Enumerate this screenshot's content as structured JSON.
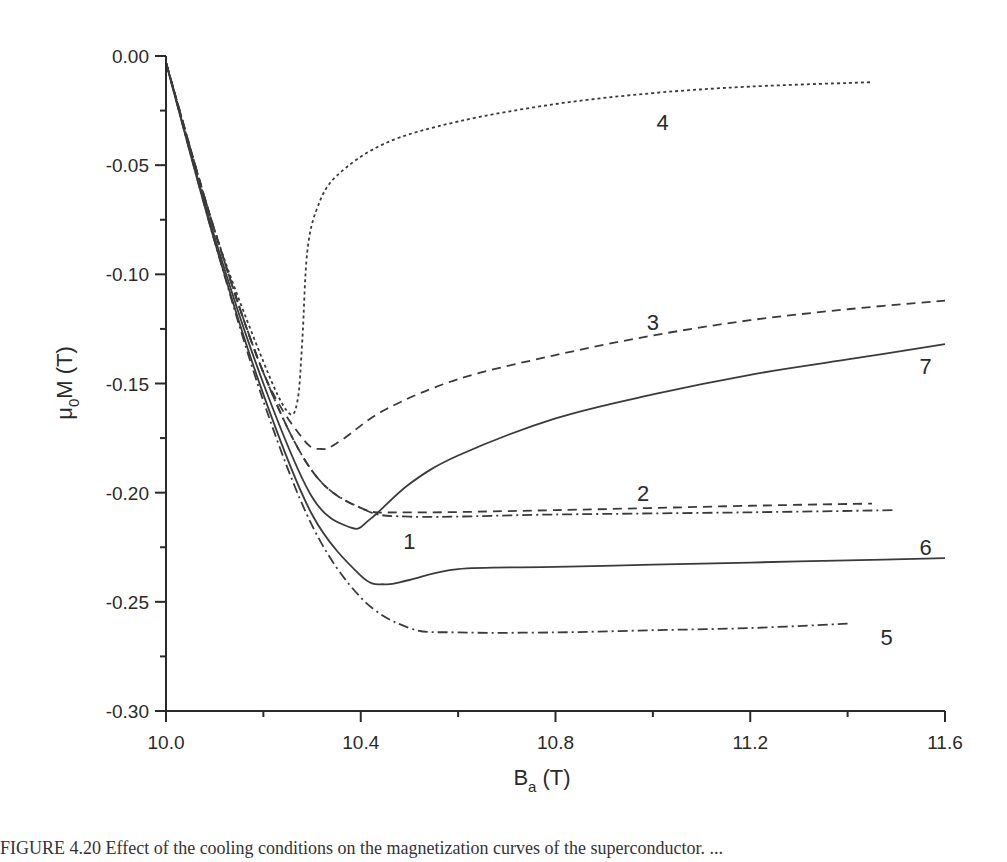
{
  "chart_data": {
    "type": "line",
    "title": "",
    "xlabel": "B_a (T)",
    "ylabel": "μ0M (T)",
    "xlim": [
      10.0,
      11.6
    ],
    "ylim": [
      -0.3,
      0.0
    ],
    "grid": false,
    "legend": "inline curve number labels",
    "x_ticks": [
      "10.0",
      "10.4",
      "10.8",
      "11.2",
      "11.6"
    ],
    "y_ticks": [
      "0.00",
      "-0.05",
      "-0.10",
      "-0.15",
      "-0.20",
      "-0.25",
      "-0.30"
    ],
    "series": [
      {
        "name": "1",
        "style": "dash-dot",
        "points": [
          [
            10.0,
            -0.003
          ],
          [
            10.1,
            -0.08
          ],
          [
            10.2,
            -0.145
          ],
          [
            10.3,
            -0.19
          ],
          [
            10.4,
            -0.207
          ],
          [
            10.5,
            -0.211
          ],
          [
            10.8,
            -0.21
          ],
          [
            11.2,
            -0.209
          ],
          [
            11.5,
            -0.208
          ]
        ]
      },
      {
        "name": "2",
        "style": "dashed",
        "points": [
          [
            10.0,
            -0.003
          ],
          [
            10.1,
            -0.08
          ],
          [
            10.2,
            -0.145
          ],
          [
            10.3,
            -0.19
          ],
          [
            10.4,
            -0.207
          ],
          [
            10.5,
            -0.209
          ],
          [
            10.8,
            -0.208
          ],
          [
            11.2,
            -0.206
          ],
          [
            11.45,
            -0.205
          ]
        ]
      },
      {
        "name": "3",
        "style": "dashed",
        "points": [
          [
            10.0,
            -0.003
          ],
          [
            10.1,
            -0.08
          ],
          [
            10.2,
            -0.145
          ],
          [
            10.28,
            -0.175
          ],
          [
            10.32,
            -0.18
          ],
          [
            10.36,
            -0.176
          ],
          [
            10.45,
            -0.162
          ],
          [
            10.6,
            -0.148
          ],
          [
            10.8,
            -0.137
          ],
          [
            11.0,
            -0.128
          ],
          [
            11.2,
            -0.121
          ],
          [
            11.4,
            -0.116
          ],
          [
            11.6,
            -0.112
          ]
        ]
      },
      {
        "name": "4",
        "style": "dotted",
        "points": [
          [
            10.0,
            -0.003
          ],
          [
            10.1,
            -0.08
          ],
          [
            10.2,
            -0.14
          ],
          [
            10.25,
            -0.163
          ],
          [
            10.27,
            -0.158
          ],
          [
            10.28,
            -0.13
          ],
          [
            10.29,
            -0.09
          ],
          [
            10.31,
            -0.07
          ],
          [
            10.35,
            -0.055
          ],
          [
            10.45,
            -0.04
          ],
          [
            10.6,
            -0.03
          ],
          [
            10.8,
            -0.022
          ],
          [
            11.0,
            -0.017
          ],
          [
            11.2,
            -0.014
          ],
          [
            11.45,
            -0.012
          ]
        ]
      },
      {
        "name": "5",
        "style": "dash-dot",
        "points": [
          [
            10.0,
            -0.003
          ],
          [
            10.1,
            -0.085
          ],
          [
            10.2,
            -0.158
          ],
          [
            10.3,
            -0.215
          ],
          [
            10.4,
            -0.248
          ],
          [
            10.5,
            -0.262
          ],
          [
            10.6,
            -0.264
          ],
          [
            10.8,
            -0.264
          ],
          [
            11.0,
            -0.263
          ],
          [
            11.2,
            -0.262
          ],
          [
            11.4,
            -0.26
          ]
        ]
      },
      {
        "name": "6",
        "style": "solid",
        "points": [
          [
            10.0,
            -0.003
          ],
          [
            10.1,
            -0.085
          ],
          [
            10.2,
            -0.155
          ],
          [
            10.3,
            -0.21
          ],
          [
            10.4,
            -0.238
          ],
          [
            10.45,
            -0.242
          ],
          [
            10.5,
            -0.24
          ],
          [
            10.6,
            -0.235
          ],
          [
            10.8,
            -0.234
          ],
          [
            11.0,
            -0.233
          ],
          [
            11.2,
            -0.232
          ],
          [
            11.4,
            -0.231
          ],
          [
            11.6,
            -0.23
          ]
        ]
      },
      {
        "name": "7",
        "style": "solid",
        "points": [
          [
            10.0,
            -0.003
          ],
          [
            10.1,
            -0.083
          ],
          [
            10.2,
            -0.15
          ],
          [
            10.3,
            -0.202
          ],
          [
            10.38,
            -0.216
          ],
          [
            10.42,
            -0.212
          ],
          [
            10.5,
            -0.196
          ],
          [
            10.6,
            -0.183
          ],
          [
            10.8,
            -0.166
          ],
          [
            11.0,
            -0.155
          ],
          [
            11.2,
            -0.146
          ],
          [
            11.4,
            -0.139
          ],
          [
            11.6,
            -0.132
          ]
        ]
      }
    ],
    "annotations": [
      {
        "text": "1",
        "x": 10.5,
        "y": -0.222
      },
      {
        "text": "2",
        "x": 10.98,
        "y": -0.2
      },
      {
        "text": "3",
        "x": 11.0,
        "y": -0.122
      },
      {
        "text": "4",
        "x": 11.02,
        "y": -0.03
      },
      {
        "text": "5",
        "x": 11.48,
        "y": -0.266
      },
      {
        "text": "6",
        "x": 11.56,
        "y": -0.225
      },
      {
        "text": "7",
        "x": 11.56,
        "y": -0.142
      }
    ]
  },
  "axes": {
    "x_title_main": "B",
    "x_title_sub": "a",
    "x_title_unit": " (T)",
    "y_title_prefix": "μ",
    "y_title_sub": "0",
    "y_title_rest": "M (T)"
  },
  "caption": "FIGURE 4.20   Effect of the cooling conditions on the magnetization curves of the superconductor. ..."
}
